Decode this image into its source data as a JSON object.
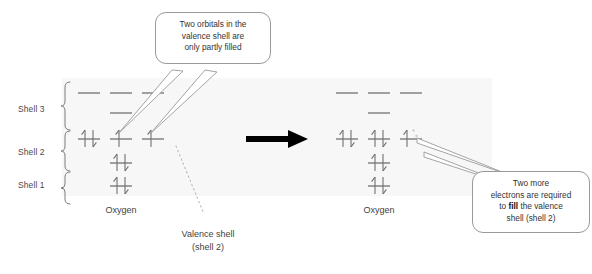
{
  "figure": {
    "type": "orbital-box-diagram",
    "topic": "Oxygen valence shell electron configuration",
    "background_color": "#ffffff",
    "band_color": "#f7f7f7",
    "line_color": "#8a8a8a",
    "arrow_color": "#000000"
  },
  "shell_labels": [
    {
      "id": "shell-3",
      "text": "Shell 3"
    },
    {
      "id": "shell-2",
      "text": "Shell 2"
    },
    {
      "id": "shell-1",
      "text": "Shell 1"
    }
  ],
  "atoms": [
    {
      "id": "left",
      "label": "Oxygen"
    },
    {
      "id": "right",
      "label": "Oxygen"
    }
  ],
  "callouts": {
    "top": {
      "line1": "Two orbitals in the",
      "line2": "valence shell are",
      "line3": "only partly filled"
    },
    "bottom_right": {
      "line1": "Two more",
      "line2": "electrons are required",
      "line3_pre": "to ",
      "line3_bold": "fill",
      "line3_post": " the valence",
      "line4": "shell (shell 2)"
    }
  },
  "annotations": {
    "valence_shell": "Valence shell\n(shell 2)"
  },
  "transform_arrow": {
    "name": "right-arrow",
    "direction": "right"
  },
  "orbitals": {
    "left_atom": {
      "shell3_top_row": [
        "empty",
        "empty",
        "empty"
      ],
      "shell3_second_row": [
        "empty"
      ],
      "shell2_row": [
        "paired",
        "single-up",
        "single-up"
      ],
      "shell2_lower": [
        "paired"
      ],
      "shell1": [
        "paired"
      ]
    },
    "right_atom": {
      "shell3_top_row": [
        "empty",
        "empty",
        "empty"
      ],
      "shell3_second_row": [
        "empty"
      ],
      "shell2_row": [
        "paired",
        "paired",
        "single-up-with-dots"
      ],
      "shell2_lower": [
        "paired"
      ],
      "shell1": [
        "paired"
      ]
    }
  }
}
